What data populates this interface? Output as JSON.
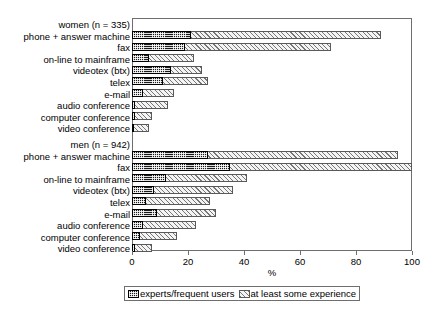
{
  "chart_data": {
    "type": "bar",
    "orientation": "horizontal",
    "title": "",
    "xlabel": "%",
    "ylabel": "",
    "xlim": [
      0,
      100
    ],
    "xticks": [
      0,
      20,
      40,
      60,
      80,
      100
    ],
    "grid": false,
    "legend_position": "below-axis",
    "bar_style": "overlaid",
    "groups": [
      {
        "name": "women (n = 335)",
        "categories": [
          "phone + answer machine",
          "fax",
          "on-line to mainframe",
          "videotex (btx)",
          "telex",
          "e-mail",
          "audio conference",
          "computer conference",
          "video conference"
        ],
        "series": [
          {
            "name": "experts/frequent users",
            "values": [
              21,
              19,
              6,
              14,
              11,
              4,
              1,
              1,
              0.5
            ]
          },
          {
            "name": "at least some experience",
            "values": [
              89,
              71,
              22,
              25,
              27,
              15,
              13,
              7,
              6
            ]
          }
        ]
      },
      {
        "name": "men (n = 942)",
        "categories": [
          "phone + answer machine",
          "fax",
          "on-line to mainframe",
          "videotex (btx)",
          "telex",
          "e-mail",
          "audio conference",
          "computer conference",
          "video conference"
        ],
        "series": [
          {
            "name": "experts/frequent users",
            "values": [
              27,
              35,
              12,
              8,
              5,
              9,
              4,
              3,
              1
            ]
          },
          {
            "name": "at least some experience",
            "values": [
              95,
              100,
              41,
              36,
              28,
              30,
              23,
              16,
              7
            ]
          }
        ]
      }
    ],
    "legend": [
      "experts/frequent users",
      "at least some experience"
    ],
    "colors": {
      "experts_fill": "#1a1a1a",
      "experience_fill": "#f4f4f4",
      "experience_hatch": "#777777",
      "frame": "#6e6e6e",
      "text": "#000000"
    }
  }
}
